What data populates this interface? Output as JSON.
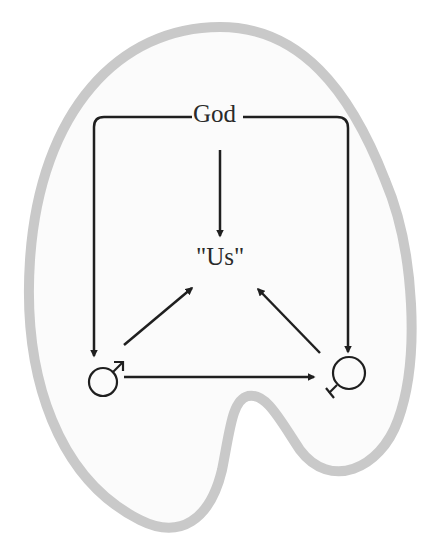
{
  "diagram": {
    "title": "",
    "nodes": {
      "god": {
        "label": "God"
      },
      "us": {
        "label": "\"Us\""
      },
      "male": {
        "label": "",
        "symbol": "male-symbol"
      },
      "female": {
        "label": "",
        "symbol": "female-symbol"
      }
    },
    "edges": [
      {
        "from": "god",
        "to": "male",
        "style": "bracket-left"
      },
      {
        "from": "god",
        "to": "female",
        "style": "bracket-right"
      },
      {
        "from": "god",
        "to": "us",
        "style": "straight"
      },
      {
        "from": "male",
        "to": "us",
        "style": "straight"
      },
      {
        "from": "female",
        "to": "us",
        "style": "straight"
      },
      {
        "from": "male",
        "to": "female",
        "style": "straight"
      }
    ],
    "colors": {
      "outline": "#c9c9c9",
      "fill": "#fbfbfb",
      "ink": "#1f1f1f"
    }
  }
}
